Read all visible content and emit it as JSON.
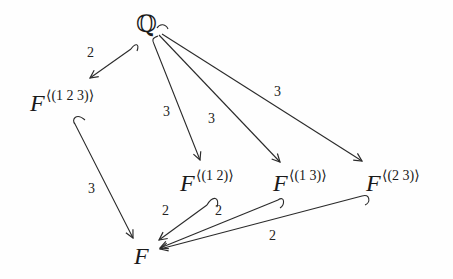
{
  "diagram": {
    "type": "field-extension-lattice",
    "nodes": {
      "Q": {
        "label": "ℚ"
      },
      "F123": {
        "base": "F",
        "sup": "⟨(1 2 3)⟩"
      },
      "F12": {
        "base": "F",
        "sup": "⟨(1 2)⟩"
      },
      "F13": {
        "base": "F",
        "sup": "⟨(1 3)⟩"
      },
      "F23": {
        "base": "F",
        "sup": "⟨(2 3)⟩"
      },
      "F": {
        "label": "F"
      }
    },
    "edges": [
      {
        "from": "Q",
        "to": "F123",
        "label": "2",
        "style": "hook-arrow"
      },
      {
        "from": "Q",
        "to": "F12",
        "label": "3",
        "style": "hook-arrow"
      },
      {
        "from": "Q",
        "to": "F13",
        "label": "3",
        "style": "hook-arrow"
      },
      {
        "from": "Q",
        "to": "F23",
        "label": "3",
        "style": "hook-arrow"
      },
      {
        "from": "F123",
        "to": "F",
        "label": "3",
        "style": "hook-arrow"
      },
      {
        "from": "F12",
        "to": "F",
        "label": "2",
        "style": "hook-arrow"
      },
      {
        "from": "F13",
        "to": "F",
        "label": "2",
        "style": "hook-arrow"
      },
      {
        "from": "F23",
        "to": "F",
        "label": "2",
        "style": "hook-arrow"
      }
    ],
    "colors": {
      "ink": "#1a1a1a",
      "background": "#fefefe"
    }
  }
}
